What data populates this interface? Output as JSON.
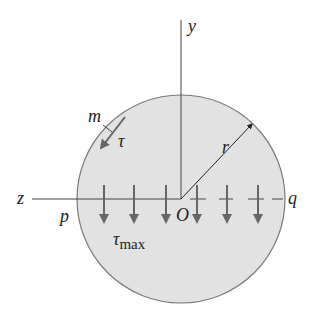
{
  "diagram": {
    "title": "",
    "labels": {
      "y_axis": "y",
      "z_axis": "z",
      "origin": "O",
      "radius": "r",
      "point_m": "m",
      "point_p": "p",
      "point_q": "q",
      "tau": "τ",
      "tau_max_symbol": "τ",
      "tau_max_subscript": "max"
    },
    "colors": {
      "circle_fill": "#e2e2e2",
      "circle_stroke": "#7a7a7a",
      "axis": "#444444",
      "arrow": "#666666",
      "text": "#222222"
    },
    "geometry": {
      "center": [
        181,
        199
      ],
      "radius": 104,
      "stress_arrow_x": [
        104,
        134,
        166,
        197,
        227,
        258
      ]
    }
  }
}
